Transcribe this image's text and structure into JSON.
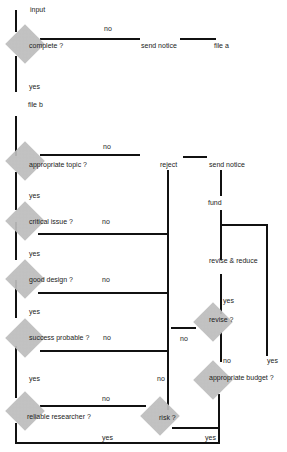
{
  "diagram": {
    "type": "flowchart",
    "nodes": {
      "input": "input",
      "complete": "complete ?",
      "send_notice_1": "send notice",
      "file_a": "file a",
      "file_b": "file b",
      "appropriate_topic": "appropriate topic ?",
      "reject": "reject",
      "send_notice_2": "send notice",
      "fund": "fund",
      "critical_issue": "critical issue ?",
      "revise_reduce": "revise & reduce",
      "good_design": "good design ?",
      "revise": "revise ?",
      "success_probable": "success probable ?",
      "appropriate_budget": "appropriate budget ?",
      "reliable_researcher": "reliable researcher ?",
      "risk": "risk ?"
    },
    "edge_labels": {
      "complete_no": "no",
      "complete_yes": "yes",
      "topic_no": "no",
      "topic_yes": "yes",
      "critical_no": "no",
      "critical_yes": "yes",
      "design_no": "no",
      "design_yes": "yes",
      "success_no": "no",
      "success_yes": "yes",
      "revise_yes": "yes",
      "revise_no": "no",
      "revise_no_left": "no",
      "budget_no": "no",
      "budget_yes": "yes",
      "researcher_no": "no",
      "researcher_yes": "yes",
      "risk_no": "no",
      "risk_yes": "yes"
    }
  }
}
